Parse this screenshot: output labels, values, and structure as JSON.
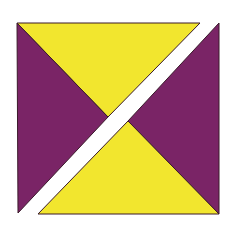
{
  "figure": {
    "colors": {
      "yellow": "#f2e62e",
      "purple": "#7a2466",
      "gap": "#ffffff",
      "outline": "#3a1a2a",
      "background": "#ffffff"
    },
    "pieces": [
      {
        "name": "top-yellow-triangle",
        "color": "yellow",
        "points": "17,23 200,23 108,117"
      },
      {
        "name": "left-purple-triangle",
        "color": "purple",
        "points": "17,23 108,117 18,213"
      },
      {
        "name": "right-purple-triangle",
        "color": "purple",
        "points": "219,23 219,214 128,121"
      },
      {
        "name": "bottom-yellow-triangle",
        "color": "yellow",
        "points": "128,121 219,214 38,214"
      }
    ]
  }
}
